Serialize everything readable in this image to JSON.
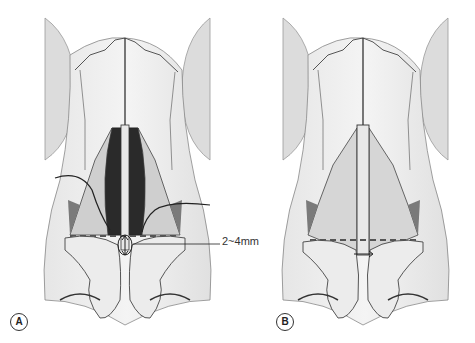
{
  "figure": {
    "panels": [
      {
        "id": "A",
        "label": "A",
        "description": "Nasal anatomy, dorsal view, with dark open nasal vault, curved incision lines and 2~4mm measurement arrow at caudal septum"
      },
      {
        "id": "B",
        "label": "B",
        "description": "Nasal anatomy, dorsal view after closure, dashed line across upper lateral cartilages with short horizontal arrow"
      }
    ],
    "annotation": {
      "measurement": "2~4mm"
    },
    "colors": {
      "line": "#333333",
      "shade_dark": "#2a2a2a",
      "shade_mid": "#7a7a7a",
      "skin": "#d9d9d9",
      "cartilage": "#ececec",
      "dash": "#555555"
    }
  }
}
